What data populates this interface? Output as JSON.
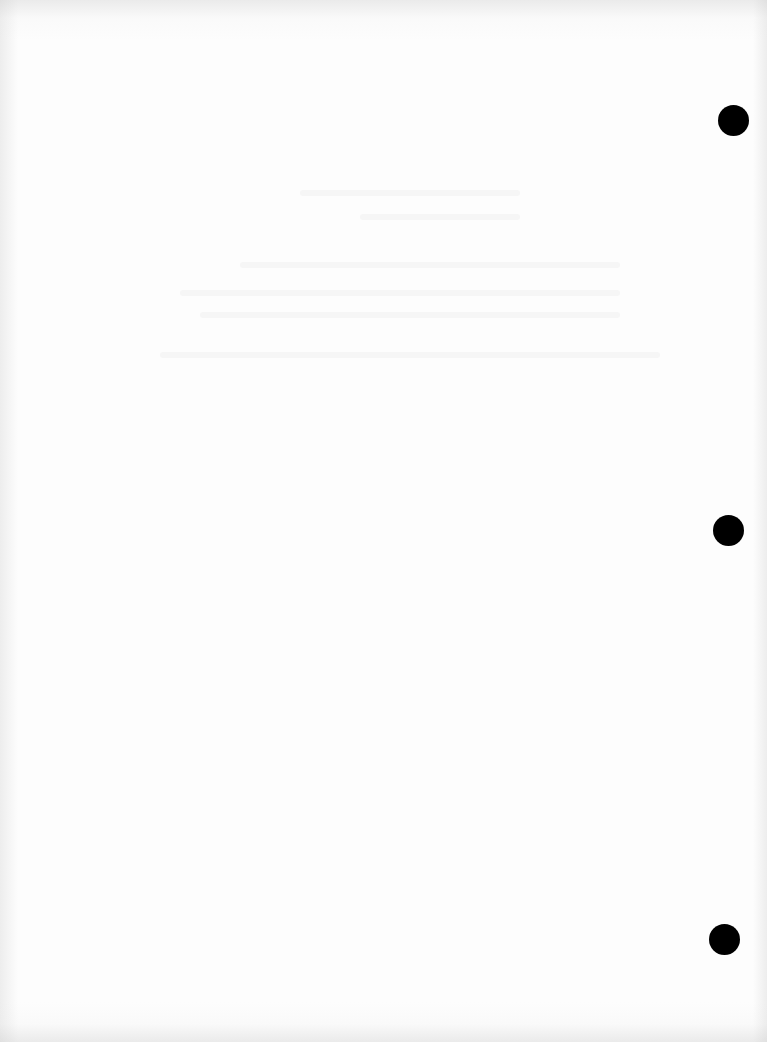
{
  "document": {
    "type": "scanned blank page",
    "background_color": "#fdfdfd",
    "edge_tint": "#ececec",
    "text_content": "",
    "hole_punches": [
      {
        "label": "top",
        "cx": 733,
        "cy": 120,
        "r": 15,
        "color": "#000000"
      },
      {
        "label": "middle",
        "cx": 728,
        "cy": 530,
        "r": 15,
        "color": "#000000"
      },
      {
        "label": "bottom",
        "cx": 724,
        "cy": 939,
        "r": 15,
        "color": "#000000"
      }
    ]
  }
}
